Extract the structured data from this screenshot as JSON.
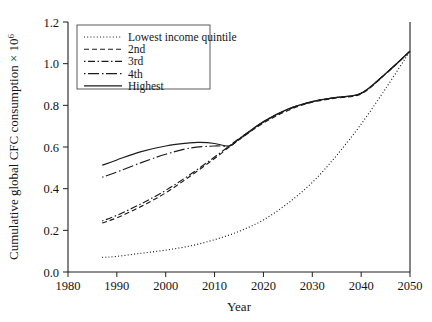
{
  "chart_data": {
    "type": "line",
    "title": "",
    "xlabel": "Year",
    "ylabel": "Cumulative global CFC consumption × 10",
    "ylabel_exponent": "6",
    "xlim": [
      1980,
      2050
    ],
    "ylim": [
      0.0,
      1.2
    ],
    "xticks": [
      1980,
      1990,
      2000,
      2010,
      2020,
      2030,
      2040,
      2050
    ],
    "xticklabels": [
      "1980",
      "1990",
      "2000",
      "2010",
      "2020",
      "2030",
      "2040",
      "2050"
    ],
    "yticks": [
      0.0,
      0.2,
      0.4,
      0.6,
      0.8,
      1.0,
      1.2
    ],
    "yticklabels": [
      "0.0",
      "0.2",
      "0.4",
      "0.6",
      "0.8",
      "1.0",
      "1.2"
    ],
    "grid": false,
    "legend_position": "upper-left",
    "series": [
      {
        "name": "Lowest income quintile",
        "style": "dotted",
        "dash": "1,2.2",
        "x": [
          1987,
          1990,
          1995,
          2000,
          2005,
          2010,
          2015,
          2020,
          2025,
          2030,
          2035,
          2040,
          2045,
          2050
        ],
        "y": [
          0.07,
          0.075,
          0.09,
          0.105,
          0.125,
          0.155,
          0.195,
          0.25,
          0.33,
          0.43,
          0.56,
          0.71,
          0.88,
          1.06
        ]
      },
      {
        "name": "2nd",
        "style": "dashed-short",
        "dash": "5,3",
        "x": [
          1987,
          1990,
          1995,
          2000,
          2005,
          2010,
          2013,
          2015,
          2020,
          2025,
          2030,
          2035,
          2040,
          2045,
          2050
        ],
        "y": [
          0.235,
          0.26,
          0.315,
          0.38,
          0.46,
          0.545,
          0.6,
          0.635,
          0.715,
          0.775,
          0.815,
          0.835,
          0.855,
          0.95,
          1.06
        ]
      },
      {
        "name": "3rd",
        "style": "dash-dot",
        "dash": "1.5,2.5,7,2.5",
        "x": [
          1987,
          1990,
          1995,
          2000,
          2005,
          2010,
          2013,
          2015,
          2020,
          2025,
          2030,
          2035,
          2040,
          2045,
          2050
        ],
        "y": [
          0.245,
          0.272,
          0.328,
          0.392,
          0.468,
          0.552,
          0.605,
          0.64,
          0.72,
          0.78,
          0.818,
          0.838,
          0.858,
          0.952,
          1.06
        ]
      },
      {
        "name": "4th",
        "style": "dash-long",
        "dash": "1.5,2.5,11,3",
        "x": [
          1987,
          1990,
          1995,
          2000,
          2005,
          2010,
          2013,
          2015,
          2020,
          2025,
          2030,
          2035,
          2040,
          2045,
          2050
        ],
        "y": [
          0.455,
          0.48,
          0.525,
          0.565,
          0.595,
          0.605,
          0.605,
          0.635,
          0.72,
          0.78,
          0.818,
          0.838,
          0.858,
          0.952,
          1.06
        ]
      },
      {
        "name": "Highest",
        "style": "solid",
        "dash": "",
        "x": [
          1987,
          1990,
          1995,
          2000,
          2005,
          2007,
          2010,
          2013,
          2015,
          2020,
          2025,
          2030,
          2035,
          2040,
          2045,
          2050
        ],
        "y": [
          0.512,
          0.538,
          0.578,
          0.605,
          0.62,
          0.622,
          0.617,
          0.605,
          0.638,
          0.722,
          0.782,
          0.818,
          0.838,
          0.858,
          0.952,
          1.06
        ]
      }
    ]
  },
  "legend": {
    "items": [
      {
        "label": "Lowest income quintile",
        "dash": "1,2.2"
      },
      {
        "label": "2nd",
        "dash": "5,3"
      },
      {
        "label": "3rd",
        "dash": "1.5,2.5,7,2.5"
      },
      {
        "label": "4th",
        "dash": "1.5,2.5,11,3"
      },
      {
        "label": "Highest",
        "dash": ""
      }
    ]
  },
  "colors": {
    "line": "#1b1b1b",
    "axis": "#1f1f1f",
    "text": "#141414",
    "background": "#ffffff"
  }
}
